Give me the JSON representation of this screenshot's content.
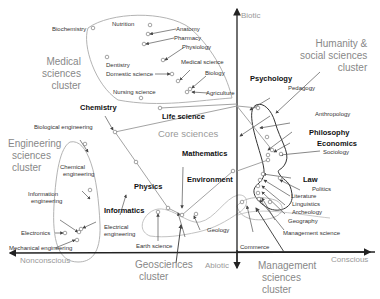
{
  "axes": {
    "top": "Biotic",
    "bottom": "Abiotic",
    "left": "Nonconscious",
    "right": "Conscious"
  },
  "clusters": {
    "medical": [
      "Medical",
      "sciences",
      "cluster"
    ],
    "engineering": [
      "Engineering",
      "sciences",
      "cluster"
    ],
    "humanity": [
      "Humanity &",
      "social sciences",
      "cluster"
    ],
    "geosciences": [
      "Geosciences",
      "cluster"
    ],
    "management": [
      "Management",
      "sciences",
      "cluster"
    ],
    "core": "Core sciences"
  },
  "disciplines": {
    "biochemistry": "Biochemistry",
    "nutrition": "Nutrition",
    "anatomy": "Anatomy",
    "pharmacy": "Pharmacy",
    "physiology": "Physiology",
    "dentistry": "Dentistry",
    "medical_science": "Medical science",
    "domestic_science": "Domestic science",
    "biology": "Biology",
    "nursing_science": "Nursing science",
    "agriculture": "Agriculture",
    "chemistry": "Chemistry",
    "life_science": "Life science",
    "biological_engineering": "Biological engineering",
    "chemical_engineering": [
      "Chemical",
      "engineering"
    ],
    "information_engineering": [
      "Information",
      "engineering"
    ],
    "electronics": "Electronics",
    "electrical_engineering": [
      "Electrical",
      "engineering"
    ],
    "mechanical_engineering": "Mechanical engineering",
    "physics": "Physics",
    "mathematics": "Mathematics",
    "environment": "Environment",
    "informatics": "Informatics",
    "earth_science": "Earth science",
    "geology": "Geology",
    "psychology": "Psychology",
    "pedagogy": "Pedagogy",
    "anthropology": "Anthropology",
    "philosophy": "Philosophy",
    "economics": "Economics",
    "sociology": "Sociology",
    "law": "Law",
    "politics": "Politics",
    "literature": "Literature",
    "linguistics": "Linguistics",
    "archeology": "Archeology",
    "geography": "Geography",
    "management_science": "Management science",
    "commerce": "Commerce"
  },
  "colors": {
    "axis": "#222222",
    "cluster_outline": "#aaaaaa",
    "human_outline": "#333333",
    "leader": "#555555",
    "cluster_text": "#888888"
  }
}
